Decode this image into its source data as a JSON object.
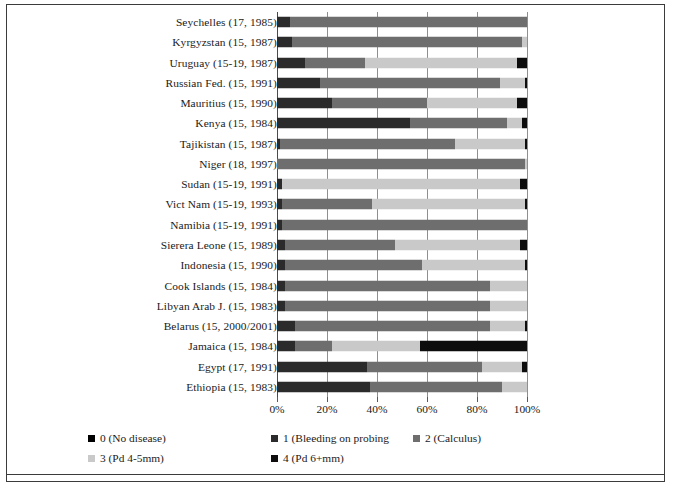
{
  "chart_data": {
    "type": "bar",
    "orientation": "horizontal",
    "stacked": true,
    "stack_mode": "percent",
    "title": "",
    "subtitle": "",
    "xlabel": "",
    "ylabel": "",
    "xlim": [
      0,
      100
    ],
    "xticks": [
      0,
      20,
      40,
      60,
      80,
      100
    ],
    "xtick_labels": [
      "0%",
      "20%",
      "40%",
      "60%",
      "80%",
      "100%"
    ],
    "grid": true,
    "grid_axis": "x",
    "legend_position": "bottom-left",
    "categories": [
      "Seychelles (17, 1985)",
      "Kyrgyzstan (15, 1987)",
      "Uruguay (15-19, 1987)",
      "Russian Fed. (15, 1991)",
      "Mauritius (15, 1990)",
      "Kenya (15, 1984)",
      "Tajikistan (15, 1987)",
      "Niger (18, 1997)",
      "Sudan (15-19, 1991)",
      "Vict Nam (15-19, 1993)",
      "Namibia (15-19, 1991)",
      "Sierera Leone (15, 1989)",
      "Indonesia (15, 1990)",
      "Cook Islands (15, 1984)",
      "Libyan Arab J. (15, 1983)",
      "Belarus (15, 2000/2001)",
      "Jamaica (15, 1984)",
      "Egypt (17, 1991)",
      "Ethiopia (15, 1983)"
    ],
    "series": [
      {
        "name": "0 (No disease)",
        "color": "#000000",
        "values": [
          0,
          0,
          0,
          0,
          0,
          0,
          0,
          0,
          0,
          0,
          0,
          0,
          0,
          0,
          0,
          0,
          0,
          0,
          0
        ]
      },
      {
        "name": "1 (Bleeding on probing",
        "color": "#2b2b2b",
        "values": [
          5,
          6,
          11,
          17,
          22,
          53,
          1,
          0,
          2,
          2,
          2,
          3,
          3,
          3,
          3,
          7,
          7,
          36,
          37
        ]
      },
      {
        "name": "2 (Calculus)",
        "color": "#6e6e6e",
        "values": [
          95,
          92,
          24,
          72,
          38,
          39,
          70,
          99,
          0,
          36,
          98,
          44,
          55,
          82,
          82,
          78,
          15,
          46,
          53
        ]
      },
      {
        "name": "3 (Pd 4-5mm)",
        "color": "#c9c9c9",
        "values": [
          0,
          2,
          61,
          10,
          36,
          6,
          28,
          1,
          95,
          61,
          0,
          50,
          41,
          15,
          15,
          14,
          35,
          16,
          10
        ]
      },
      {
        "name": "4 (Pd 6+mm)",
        "color": "#0d0d0d",
        "values": [
          0,
          0,
          4,
          1,
          4,
          2,
          1,
          0,
          3,
          1,
          0,
          3,
          1,
          0,
          0,
          1,
          43,
          2,
          0
        ]
      }
    ]
  },
  "legend": {
    "entries": [
      {
        "label": "0 (No disease)",
        "color": "#000000"
      },
      {
        "label": "1 (Bleeding on probing",
        "color": "#2b2b2b"
      },
      {
        "label": "2 (Calculus)",
        "color": "#6e6e6e"
      },
      {
        "label": "3 (Pd 4-5mm)",
        "color": "#c9c9c9"
      },
      {
        "label": "4 (Pd 6+mm)",
        "color": "#0d0d0d"
      }
    ]
  },
  "colors": {
    "frame": "#3b3b3b",
    "gridline": "#8f8f8f",
    "axis": "#4a4a4a",
    "background": "#ffffff",
    "text": "#1a1a1a"
  }
}
